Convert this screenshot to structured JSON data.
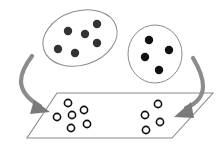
{
  "diagram": {
    "width": 224,
    "height": 150,
    "colors": {
      "background": "#ffffff",
      "outline": "#8a8a8a",
      "arrow": "#8c8c8c",
      "arrow_head": "#7a7a7a",
      "filled_dot_left": "#333333",
      "filled_dot_right": "#111111",
      "hollow_dot_stroke": "#111111",
      "plane_fill": "#ffffff"
    },
    "source_groups": [
      {
        "name": "left-cluster",
        "shape": "ellipse",
        "cx": 80,
        "cy": 38,
        "rx": 38,
        "ry": 27,
        "rotate": -18,
        "dot_color_key": "filled_dot_left",
        "dots": [
          {
            "x": 68,
            "y": 31
          },
          {
            "x": 85,
            "y": 34
          },
          {
            "x": 97,
            "y": 24
          },
          {
            "x": 97,
            "y": 43
          },
          {
            "x": 58,
            "y": 49
          },
          {
            "x": 75,
            "y": 53
          }
        ]
      },
      {
        "name": "right-cluster",
        "shape": "circle",
        "cx": 155,
        "cy": 54,
        "rx": 27,
        "ry": 29,
        "rotate": 0,
        "dot_color_key": "filled_dot_right",
        "dots": [
          {
            "x": 149,
            "y": 40
          },
          {
            "x": 169,
            "y": 50
          },
          {
            "x": 145,
            "y": 57
          },
          {
            "x": 159,
            "y": 70
          }
        ]
      }
    ],
    "plane": {
      "points": [
        [
          57,
          93
        ],
        [
          213,
          93
        ],
        [
          172,
          138
        ],
        [
          27,
          138
        ]
      ]
    },
    "target_groups": [
      {
        "name": "left-hollow-group",
        "dots": [
          {
            "x": 68,
            "y": 103
          },
          {
            "x": 57,
            "y": 117
          },
          {
            "x": 72,
            "y": 115
          },
          {
            "x": 84,
            "y": 110
          },
          {
            "x": 71,
            "y": 128
          },
          {
            "x": 87,
            "y": 124
          }
        ]
      },
      {
        "name": "right-hollow-group",
        "dots": [
          {
            "x": 158,
            "y": 104
          },
          {
            "x": 145,
            "y": 115
          },
          {
            "x": 160,
            "y": 122
          },
          {
            "x": 146,
            "y": 130
          }
        ]
      }
    ],
    "arrows": [
      {
        "name": "left-arrow",
        "path": "M32,56 C20,72 12,90 40,106",
        "head": [
          [
            34,
            100
          ],
          [
            50,
            112
          ],
          [
            30,
            114
          ]
        ]
      },
      {
        "name": "right-arrow",
        "path": "M193,58 C205,78 210,98 186,108",
        "head": [
          [
            191,
            102
          ],
          [
            174,
            117
          ],
          [
            194,
            118
          ]
        ]
      }
    ],
    "dot_radius": 4.2,
    "hollow_radius": 3.6
  }
}
